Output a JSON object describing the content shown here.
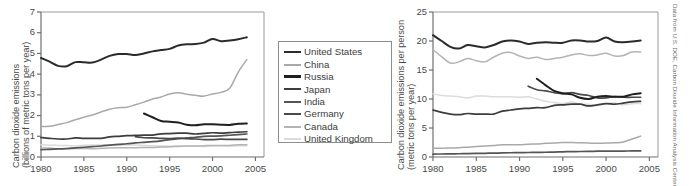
{
  "figure": {
    "credit": "Data from U.S. DOE, Carbon Dioxide Information Analysis Center"
  },
  "legend": {
    "entries": [
      {
        "label": "United States",
        "color": "#2b2b2b",
        "width": 2.6
      },
      {
        "label": "China",
        "color": "#a9a9a9",
        "width": 2.2
      },
      {
        "label": "Russia",
        "color": "#1f1f1f",
        "width": 3.0
      },
      {
        "label": "Japan",
        "color": "#3d3d3d",
        "width": 2.6
      },
      {
        "label": "India",
        "color": "#555555",
        "width": 2.2
      },
      {
        "label": "Germany",
        "color": "#4a4a4a",
        "width": 2.4
      },
      {
        "label": "Canada",
        "color": "#b4b4b4",
        "width": 2.2
      },
      {
        "label": "United Kingdom",
        "color": "#dcdcdc",
        "width": 2.2
      }
    ]
  },
  "chart_data": [
    {
      "id": "total-emissions",
      "type": "line",
      "title": "",
      "xlabel": "",
      "ylabel": "Carbon dioxide emissions (billions of metric tons per year)",
      "ylabel_line1": "Carbon dioxide emissions",
      "ylabel_line2": "(billions of metric tons per year)",
      "xlim": [
        1980,
        2006
      ],
      "ylim": [
        0,
        7
      ],
      "yticks": [
        0,
        1,
        2,
        3,
        4,
        5,
        6,
        7
      ],
      "xticks": [
        1980,
        1985,
        1990,
        1995,
        2000,
        2005
      ],
      "grid": false,
      "legend_position": "right-outside",
      "series": [
        {
          "name": "United States",
          "color": "#2b2b2b",
          "x": [
            1980,
            1981,
            1982,
            1983,
            1984,
            1985,
            1986,
            1987,
            1988,
            1989,
            1990,
            1991,
            1992,
            1993,
            1994,
            1995,
            1996,
            1997,
            1998,
            1999,
            2000,
            2001,
            2002,
            2003,
            2004
          ],
          "values": [
            4.78,
            4.6,
            4.4,
            4.38,
            4.58,
            4.57,
            4.56,
            4.7,
            4.88,
            4.97,
            4.97,
            4.92,
            5.0,
            5.1,
            5.16,
            5.22,
            5.38,
            5.44,
            5.45,
            5.52,
            5.7,
            5.59,
            5.62,
            5.68,
            5.78
          ]
        },
        {
          "name": "China",
          "color": "#a9a9a9",
          "x": [
            1980,
            1981,
            1982,
            1983,
            1984,
            1985,
            1986,
            1987,
            1988,
            1989,
            1990,
            1991,
            1992,
            1993,
            1994,
            1995,
            1996,
            1997,
            1998,
            1999,
            2000,
            2001,
            2002,
            2003,
            2004
          ],
          "values": [
            1.48,
            1.48,
            1.57,
            1.66,
            1.8,
            1.92,
            2.03,
            2.17,
            2.31,
            2.38,
            2.4,
            2.52,
            2.65,
            2.8,
            2.9,
            3.04,
            3.1,
            3.03,
            2.98,
            2.94,
            3.04,
            3.12,
            3.32,
            4.1,
            4.7
          ]
        },
        {
          "name": "Russia",
          "color": "#1f1f1f",
          "x": [
            1992,
            1993,
            1994,
            1995,
            1996,
            1997,
            1998,
            1999,
            2000,
            2001,
            2002,
            2003,
            2004
          ],
          "values": [
            2.1,
            1.92,
            1.74,
            1.7,
            1.66,
            1.56,
            1.53,
            1.58,
            1.58,
            1.56,
            1.55,
            1.6,
            1.62
          ]
        },
        {
          "name": "Japan",
          "color": "#3d3d3d",
          "x": [
            1980,
            1981,
            1982,
            1983,
            1984,
            1985,
            1986,
            1987,
            1988,
            1989,
            1990,
            1991,
            1992,
            1993,
            1994,
            1995,
            1996,
            1997,
            1998,
            1999,
            2000,
            2001,
            2002,
            2003,
            2004
          ],
          "values": [
            0.94,
            0.9,
            0.87,
            0.87,
            0.92,
            0.9,
            0.9,
            0.9,
            0.97,
            1.0,
            1.03,
            1.04,
            1.06,
            1.06,
            1.12,
            1.13,
            1.15,
            1.15,
            1.11,
            1.14,
            1.17,
            1.15,
            1.18,
            1.2,
            1.22
          ]
        },
        {
          "name": "India",
          "color": "#555555",
          "x": [
            1980,
            1981,
            1982,
            1983,
            1984,
            1985,
            1986,
            1987,
            1988,
            1989,
            1990,
            1991,
            1992,
            1993,
            1994,
            1995,
            1996,
            1997,
            1998,
            1999,
            2000,
            2001,
            2002,
            2003,
            2004
          ],
          "values": [
            0.35,
            0.37,
            0.39,
            0.41,
            0.44,
            0.47,
            0.5,
            0.53,
            0.57,
            0.61,
            0.64,
            0.68,
            0.71,
            0.74,
            0.78,
            0.84,
            0.88,
            0.92,
            0.95,
            1.0,
            1.01,
            1.02,
            1.05,
            1.08,
            1.11
          ]
        },
        {
          "name": "Germany",
          "color": "#4a4a4a",
          "x": [
            1991,
            1992,
            1993,
            1994,
            1995,
            1996,
            1997,
            1998,
            1999,
            2000,
            2001,
            2002,
            2003,
            2004
          ],
          "values": [
            0.98,
            0.93,
            0.92,
            0.9,
            0.89,
            0.91,
            0.88,
            0.87,
            0.84,
            0.84,
            0.86,
            0.85,
            0.85,
            0.85
          ]
        },
        {
          "name": "Canada",
          "color": "#b4b4b4",
          "x": [
            1980,
            1981,
            1982,
            1983,
            1984,
            1985,
            1986,
            1987,
            1988,
            1989,
            1990,
            1991,
            1992,
            1993,
            1994,
            1995,
            1996,
            1997,
            1998,
            1999,
            2000,
            2001,
            2002,
            2003,
            2004
          ],
          "values": [
            0.44,
            0.43,
            0.4,
            0.39,
            0.41,
            0.41,
            0.4,
            0.42,
            0.44,
            0.45,
            0.45,
            0.45,
            0.46,
            0.46,
            0.48,
            0.49,
            0.51,
            0.53,
            0.53,
            0.54,
            0.56,
            0.55,
            0.56,
            0.59,
            0.59
          ]
        },
        {
          "name": "United Kingdom",
          "color": "#dcdcdc",
          "x": [
            1980,
            1981,
            1982,
            1983,
            1984,
            1985,
            1986,
            1987,
            1988,
            1989,
            1990,
            1991,
            1992,
            1993,
            1994,
            1995,
            1996,
            1997,
            1998,
            1999,
            2000,
            2001,
            2002,
            2003,
            2004
          ],
          "values": [
            0.59,
            0.57,
            0.56,
            0.55,
            0.54,
            0.57,
            0.58,
            0.58,
            0.58,
            0.58,
            0.58,
            0.58,
            0.56,
            0.54,
            0.53,
            0.52,
            0.54,
            0.52,
            0.52,
            0.51,
            0.53,
            0.54,
            0.52,
            0.54,
            0.54
          ]
        }
      ]
    },
    {
      "id": "per-capita-emissions",
      "type": "line",
      "title": "",
      "xlabel": "",
      "ylabel": "Carbon dioxide emissions per person (metric tons per year)",
      "ylabel_line1": "Carbon dioxide emissions per person",
      "ylabel_line2": "(metric tons per year)",
      "xlim": [
        1980,
        2006
      ],
      "ylim": [
        0,
        25
      ],
      "yticks": [
        0,
        5,
        10,
        15,
        20,
        25
      ],
      "xticks": [
        1980,
        1985,
        1990,
        1995,
        2000,
        2005
      ],
      "grid": false,
      "legend_position": "shared-left",
      "series": [
        {
          "name": "United States",
          "color": "#2b2b2b",
          "x": [
            1980,
            1981,
            1982,
            1983,
            1984,
            1985,
            1986,
            1987,
            1988,
            1989,
            1990,
            1991,
            1992,
            1993,
            1994,
            1995,
            1996,
            1997,
            1998,
            1999,
            2000,
            2001,
            2002,
            2003,
            2004
          ],
          "values": [
            21.0,
            20.0,
            19.0,
            18.7,
            19.3,
            19.1,
            18.9,
            19.3,
            19.9,
            20.1,
            19.9,
            19.5,
            19.7,
            19.8,
            19.7,
            19.7,
            20.1,
            20.1,
            19.9,
            20.0,
            20.6,
            19.9,
            19.8,
            19.9,
            20.1
          ]
        },
        {
          "name": "Canada",
          "color": "#b4b4b4",
          "x": [
            1980,
            1981,
            1982,
            1983,
            1984,
            1985,
            1986,
            1987,
            1988,
            1989,
            1990,
            1991,
            1992,
            1993,
            1994,
            1995,
            1996,
            1997,
            1998,
            1999,
            2000,
            2001,
            2002,
            2003,
            2004
          ],
          "values": [
            18.5,
            17.3,
            16.2,
            16.4,
            17.0,
            16.6,
            16.4,
            17.2,
            17.9,
            18.0,
            17.4,
            17.0,
            17.2,
            16.8,
            17.0,
            17.2,
            17.6,
            17.8,
            17.5,
            17.6,
            17.9,
            17.4,
            17.5,
            18.1,
            18.1
          ]
        },
        {
          "name": "Russia",
          "color": "#1f1f1f",
          "x": [
            1992,
            1993,
            1994,
            1995,
            1996,
            1997,
            1998,
            1999,
            2000,
            2001,
            2002,
            2003,
            2004
          ],
          "values": [
            13.5,
            12.4,
            11.4,
            11.0,
            10.8,
            10.2,
            10.0,
            10.4,
            10.5,
            10.4,
            10.4,
            10.8,
            11.0
          ]
        },
        {
          "name": "United Kingdom",
          "color": "#dcdcdc",
          "x": [
            1980,
            1981,
            1982,
            1983,
            1984,
            1985,
            1986,
            1987,
            1988,
            1989,
            1990,
            1991,
            1992,
            1993,
            1994,
            1995,
            1996,
            1997,
            1998,
            1999,
            2000,
            2001,
            2002,
            2003,
            2004
          ],
          "values": [
            10.9,
            10.6,
            10.5,
            10.4,
            10.2,
            10.5,
            10.5,
            10.4,
            10.4,
            10.4,
            10.3,
            10.4,
            10.0,
            9.6,
            9.4,
            9.2,
            9.5,
            9.1,
            9.1,
            8.9,
            9.2,
            9.3,
            9.0,
            9.2,
            9.2
          ]
        },
        {
          "name": "Germany",
          "color": "#4a4a4a",
          "x": [
            1991,
            1992,
            1993,
            1994,
            1995,
            1996,
            1997,
            1998,
            1999,
            2000,
            2001,
            2002,
            2003,
            2004
          ],
          "values": [
            12.2,
            11.6,
            11.4,
            11.1,
            10.9,
            11.1,
            10.8,
            10.6,
            10.2,
            10.2,
            10.4,
            10.3,
            10.3,
            10.3
          ]
        },
        {
          "name": "Japan",
          "color": "#3d3d3d",
          "x": [
            1980,
            1981,
            1982,
            1983,
            1984,
            1985,
            1986,
            1987,
            1988,
            1989,
            1990,
            1991,
            1992,
            1993,
            1994,
            1995,
            1996,
            1997,
            1998,
            1999,
            2000,
            2001,
            2002,
            2003,
            2004
          ],
          "values": [
            8.1,
            7.7,
            7.4,
            7.3,
            7.5,
            7.4,
            7.4,
            7.4,
            7.9,
            8.1,
            8.3,
            8.4,
            8.5,
            8.5,
            8.9,
            9.0,
            9.1,
            9.1,
            8.8,
            9.0,
            9.2,
            9.1,
            9.3,
            9.5,
            9.6
          ]
        },
        {
          "name": "China",
          "color": "#a9a9a9",
          "x": [
            1980,
            1981,
            1982,
            1983,
            1984,
            1985,
            1986,
            1987,
            1988,
            1989,
            1990,
            1991,
            1992,
            1993,
            1994,
            1995,
            1996,
            1997,
            1998,
            1999,
            2000,
            2001,
            2002,
            2003,
            2004
          ],
          "values": [
            1.5,
            1.5,
            1.55,
            1.6,
            1.7,
            1.8,
            1.9,
            2.0,
            2.1,
            2.1,
            2.1,
            2.2,
            2.25,
            2.35,
            2.4,
            2.5,
            2.5,
            2.45,
            2.4,
            2.35,
            2.4,
            2.45,
            2.6,
            3.1,
            3.6
          ]
        },
        {
          "name": "India",
          "color": "#555555",
          "x": [
            1980,
            1981,
            1982,
            1983,
            1984,
            1985,
            1986,
            1987,
            1988,
            1989,
            1990,
            1991,
            1992,
            1993,
            1994,
            1995,
            1996,
            1997,
            1998,
            1999,
            2000,
            2001,
            2002,
            2003,
            2004
          ],
          "values": [
            0.5,
            0.52,
            0.54,
            0.56,
            0.59,
            0.62,
            0.64,
            0.67,
            0.7,
            0.73,
            0.75,
            0.78,
            0.8,
            0.82,
            0.85,
            0.9,
            0.93,
            0.95,
            0.97,
            1.0,
            1.0,
            1.0,
            1.02,
            1.04,
            1.05
          ]
        }
      ]
    }
  ]
}
